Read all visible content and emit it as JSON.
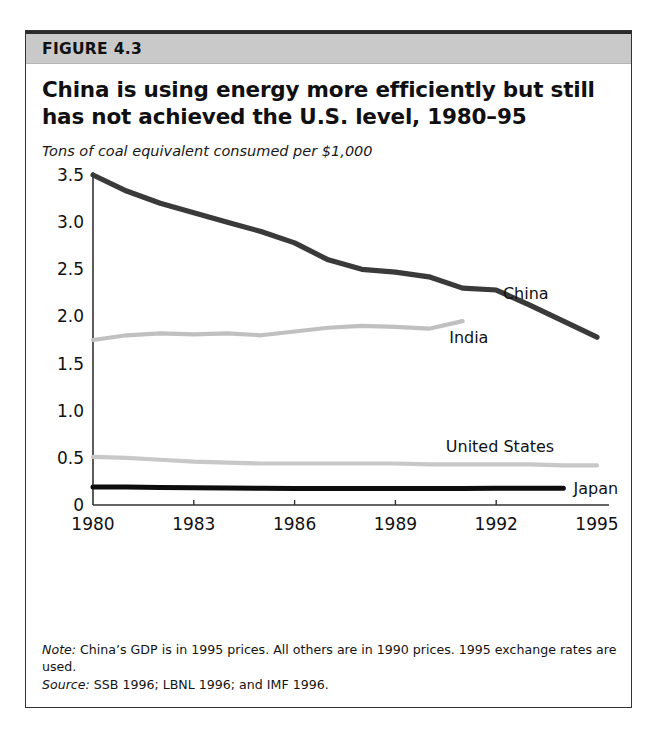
{
  "figure": {
    "number_label": "FIGURE 4.3",
    "title": "China is using energy more efficiently but still has not achieved the U.S. level, 1980–95",
    "note_key": "Note:",
    "note_text": " China’s GDP is in 1995 prices. All others are in 1990 prices. 1995 exchange rates are used.",
    "source_key": "Source:",
    "source_text": " SSB 1996; LBNL 1996; and IMF 1996."
  },
  "colors": {
    "header_band": "#c9c9c9",
    "frame": "#333333",
    "china": "#3a3a3a",
    "india": "#c0c0c0",
    "united_states": "#c8c8c8",
    "japan": "#0d0d0d",
    "axis": "#333333",
    "text": "#111111"
  },
  "chart_data": {
    "type": "line",
    "title": "China is using energy more efficiently but still has not achieved the U.S. level, 1980–95",
    "subtitle": "Tons of coal equivalent consumed per $1,000",
    "xlabel": "",
    "ylabel": "Tons of coal equivalent consumed per $1,000",
    "xlim": [
      1980,
      1995
    ],
    "ylim": [
      0,
      3.5
    ],
    "xticks": [
      1980,
      1983,
      1986,
      1989,
      1992,
      1995
    ],
    "xticklabels": [
      "1980",
      "1983",
      "1986",
      "1989",
      "1992",
      "1995"
    ],
    "yticks": [
      0,
      0.5,
      1.0,
      1.5,
      2.0,
      2.5,
      3.0,
      3.5
    ],
    "yticklabels": [
      "0",
      "0.5",
      "1.0",
      "1.5",
      "2.0",
      "2.5",
      "3.0",
      "3.5"
    ],
    "grid": false,
    "legend": "inline-labels",
    "series": [
      {
        "name": "China",
        "color": "#3a3a3a",
        "label_position": "right-of-line",
        "x": [
          1980,
          1981,
          1982,
          1983,
          1984,
          1985,
          1986,
          1987,
          1988,
          1989,
          1990,
          1991,
          1992,
          1993,
          1994,
          1995
        ],
        "values": [
          3.5,
          3.33,
          3.2,
          3.1,
          3.0,
          2.9,
          2.78,
          2.6,
          2.5,
          2.47,
          2.42,
          2.3,
          2.28,
          2.12,
          1.95,
          1.78
        ]
      },
      {
        "name": "India",
        "color": "#c0c0c0",
        "label_position": "below-line-end",
        "x": [
          1980,
          1981,
          1982,
          1983,
          1984,
          1985,
          1986,
          1987,
          1988,
          1989,
          1990,
          1991
        ],
        "values": [
          1.75,
          1.8,
          1.82,
          1.81,
          1.82,
          1.8,
          1.84,
          1.88,
          1.9,
          1.89,
          1.87,
          1.95
        ]
      },
      {
        "name": "United States",
        "color": "#c8c8c8",
        "label_position": "above-line-right",
        "x": [
          1980,
          1981,
          1982,
          1983,
          1984,
          1985,
          1986,
          1987,
          1988,
          1989,
          1990,
          1991,
          1992,
          1993,
          1994,
          1995
        ],
        "values": [
          0.51,
          0.5,
          0.48,
          0.46,
          0.45,
          0.44,
          0.44,
          0.44,
          0.44,
          0.44,
          0.43,
          0.43,
          0.43,
          0.43,
          0.42,
          0.42
        ]
      },
      {
        "name": "Japan",
        "color": "#0d0d0d",
        "label_position": "right-of-line-end",
        "x": [
          1980,
          1981,
          1982,
          1983,
          1984,
          1985,
          1986,
          1987,
          1988,
          1989,
          1990,
          1991,
          1992,
          1993,
          1994
        ],
        "values": [
          0.19,
          0.19,
          0.185,
          0.182,
          0.18,
          0.178,
          0.176,
          0.175,
          0.174,
          0.174,
          0.175,
          0.176,
          0.177,
          0.178,
          0.178
        ]
      }
    ]
  }
}
